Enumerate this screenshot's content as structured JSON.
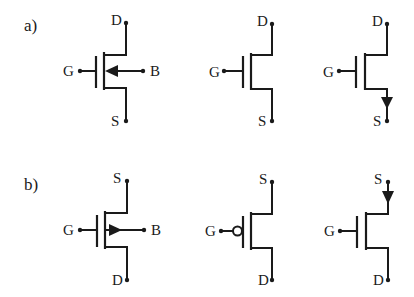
{
  "diagram": {
    "colors": {
      "ink": "#1a1a1a",
      "background": "#ffffff"
    },
    "sections": [
      {
        "label": "a)",
        "symbols": [
          {
            "type": "n-channel with body terminal",
            "terminals": {
              "top": "D",
              "gate": "G",
              "bottom": "S",
              "body": "B"
            },
            "arrow": "body-inward"
          },
          {
            "type": "n-channel simplified",
            "terminals": {
              "top": "D",
              "gate": "G",
              "bottom": "S"
            },
            "arrow": "none"
          },
          {
            "type": "n-channel with source arrow",
            "terminals": {
              "top": "D",
              "gate": "G",
              "bottom": "S"
            },
            "arrow": "source-out-down"
          }
        ]
      },
      {
        "label": "b)",
        "symbols": [
          {
            "type": "p-channel with body terminal",
            "terminals": {
              "top": "S",
              "gate": "G",
              "bottom": "D",
              "body": "B"
            },
            "arrow": "body-outward"
          },
          {
            "type": "p-channel with gate bubble",
            "terminals": {
              "top": "S",
              "gate": "G",
              "bottom": "D"
            },
            "arrow": "none",
            "gate_bubble": true
          },
          {
            "type": "p-channel with source arrow",
            "terminals": {
              "top": "S",
              "gate": "G",
              "bottom": "D"
            },
            "arrow": "source-in-down"
          }
        ]
      }
    ]
  }
}
